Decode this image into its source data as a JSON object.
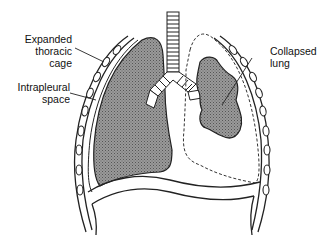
{
  "labels": {
    "expanded_thoracic_cage": [
      "Expanded",
      "thoracic",
      "cage"
    ],
    "intrapleural_space": [
      "Intrapleural",
      "space"
    ],
    "collapsed_lung": [
      "Collapsed",
      "lung"
    ]
  },
  "colors": {
    "lung_fill": "#8a8a8a",
    "line": "#222222",
    "background": "#ffffff"
  }
}
